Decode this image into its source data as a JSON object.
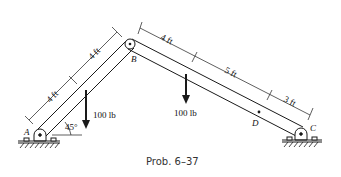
{
  "caption": "Prob. 6–37",
  "points": {
    "A": "A",
    "B": "B",
    "C": "C",
    "D": "D"
  },
  "dimensions": {
    "ab_lower": "4 ft",
    "ab_upper": "4 ft",
    "bc_first": "4 ft",
    "bc_second": "5 ft",
    "bc_third": "3 ft"
  },
  "loads": {
    "load_1": "100 lb",
    "load_2": "100 lb"
  },
  "angle": "45°",
  "colors": {
    "line": "#1a1a1a",
    "background": "#ffffff"
  }
}
